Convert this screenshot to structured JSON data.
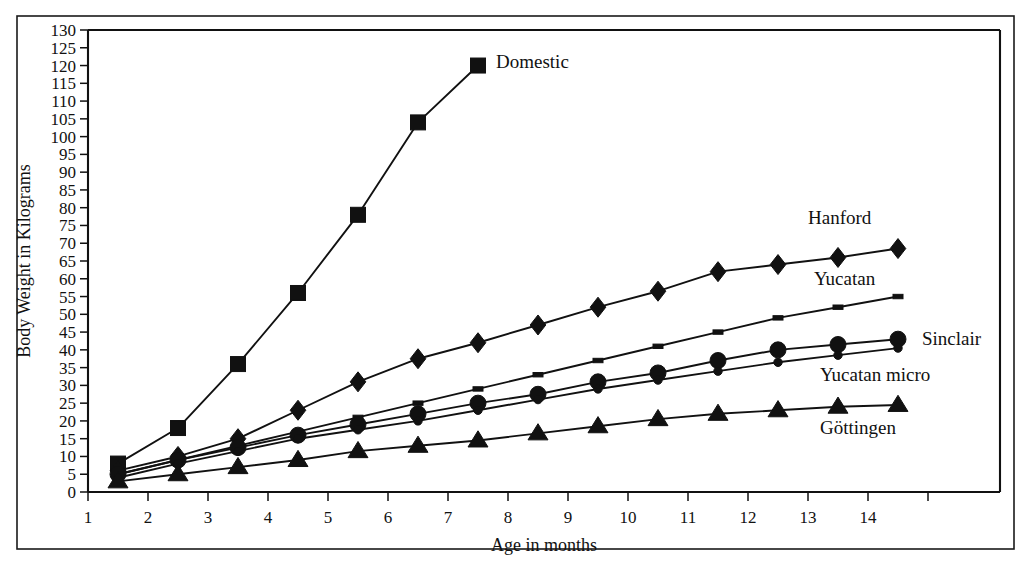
{
  "figure": {
    "top_cut_text": "· · ·",
    "background_color": "#ffffff",
    "ink_color": "#111111"
  },
  "axes": {
    "y_title": "Body Weight in Kilograms",
    "x_title": "Age in months",
    "y_ticks": [
      "0",
      "5",
      "10",
      "15",
      "20",
      "25",
      "30",
      "35",
      "40",
      "45",
      "50",
      "55",
      "60",
      "65",
      "70",
      "75",
      "80",
      "85",
      "90",
      "95",
      "100",
      "105",
      "110",
      "115",
      "120",
      "125",
      "130"
    ],
    "x_ticks": [
      "1",
      "2",
      "3",
      "4",
      "5",
      "6",
      "7",
      "8",
      "9",
      "10",
      "11",
      "12",
      "13",
      "14"
    ],
    "x_unlabeled_ticks": [
      15
    ],
    "y_min": 0,
    "y_max": 130,
    "y_step": 5,
    "x_min": 1,
    "x_max": 16.2,
    "grid": "off"
  },
  "series_labels": {
    "domestic": "Domestic",
    "hanford": "Hanford",
    "yucatan": "Yucatan",
    "sinclair": "Sinclair",
    "yucatan_micro": "Yucatan micro",
    "gottingen": "Göttingen"
  },
  "chart_data": {
    "type": "line",
    "title": "",
    "xlabel": "Age in months",
    "ylabel": "Body Weight in Kilograms",
    "xlim": [
      1,
      16.2
    ],
    "ylim": [
      0,
      130
    ],
    "ytick_step": 5,
    "grid": false,
    "legend_position": "inline-right-of-line-ends",
    "x": [
      1.5,
      2.5,
      3.5,
      4.5,
      5.5,
      6.5,
      7.5,
      8.5,
      9.5,
      10.5,
      11.5,
      12.5,
      13.5,
      14.5
    ],
    "series": [
      {
        "name": "Domestic",
        "marker": "square",
        "x": [
          1.5,
          2.5,
          3.5,
          4.5,
          5.5,
          6.5,
          7.5
        ],
        "values": [
          8,
          18,
          36,
          56,
          78,
          104,
          120
        ]
      },
      {
        "name": "Hanford",
        "marker": "diamond",
        "x": [
          1.5,
          2.5,
          3.5,
          4.5,
          5.5,
          6.5,
          7.5,
          8.5,
          9.5,
          10.5,
          11.5,
          12.5,
          13.5,
          14.5
        ],
        "values": [
          6,
          10,
          15,
          23,
          31,
          37.5,
          42,
          47,
          52,
          56.5,
          62,
          64,
          66,
          68.5
        ]
      },
      {
        "name": "Yucatan",
        "marker": "small-dash",
        "x": [
          1.5,
          2.5,
          3.5,
          4.5,
          5.5,
          6.5,
          7.5,
          8.5,
          9.5,
          10.5,
          11.5,
          12.5,
          13.5,
          14.5
        ],
        "values": [
          5,
          9,
          13,
          17,
          21,
          25,
          29,
          33,
          37,
          41,
          45,
          49,
          52,
          55
        ]
      },
      {
        "name": "Sinclair",
        "marker": "circle",
        "x": [
          1.5,
          2.5,
          3.5,
          4.5,
          5.5,
          6.5,
          7.5,
          8.5,
          9.5,
          10.5,
          11.5,
          12.5,
          13.5,
          14.5
        ],
        "values": [
          5,
          9,
          12.5,
          16,
          19,
          22,
          25,
          27.5,
          31,
          33.5,
          37,
          40,
          41.5,
          43
        ]
      },
      {
        "name": "Yucatan micro",
        "marker": "small-circle",
        "x": [
          1.5,
          2.5,
          3.5,
          4.5,
          5.5,
          6.5,
          7.5,
          8.5,
          9.5,
          10.5,
          11.5,
          12.5,
          13.5,
          14.5
        ],
        "values": [
          4,
          8,
          11.5,
          15,
          17.5,
          20,
          23,
          26,
          29,
          31.5,
          34,
          36.5,
          38.5,
          40.5
        ]
      },
      {
        "name": "Göttingen",
        "marker": "triangle",
        "x": [
          1.5,
          2.5,
          3.5,
          4.5,
          5.5,
          6.5,
          7.5,
          8.5,
          9.5,
          10.5,
          11.5,
          12.5,
          13.5,
          14.5
        ],
        "values": [
          3,
          5,
          7,
          9,
          11.5,
          13,
          14.5,
          16.5,
          18.5,
          20.5,
          22,
          23,
          24,
          24.5
        ]
      }
    ]
  },
  "label_anchors": {
    "domestic": {
      "x": 7.8,
      "y": 121
    },
    "hanford": {
      "x": 13.0,
      "y": 77
    },
    "yucatan": {
      "x": 13.1,
      "y": 60
    },
    "sinclair": {
      "x": 14.9,
      "y": 43
    },
    "yucatan_micro": {
      "x": 13.2,
      "y": 33
    },
    "gottingen": {
      "x": 13.2,
      "y": 18
    }
  }
}
